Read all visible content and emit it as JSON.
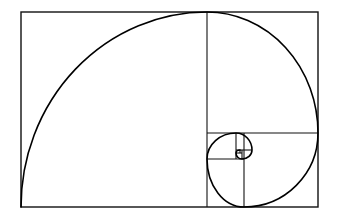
{
  "figure": {
    "background_color": "#ffffff",
    "stroke_color": "#111111",
    "spiral_color": "#000000",
    "canvas": {
      "width": 340,
      "height": 223
    }
  },
  "chart_data": {
    "type": "diagram",
    "xlabel": "",
    "ylabel": "",
    "outer_rectangle": {
      "x": 21,
      "y": 12,
      "width": 297,
      "height": 195,
      "aspect_ratio": 1.523
    },
    "squares": [
      {
        "index": 1,
        "label": "square-1",
        "x": 21,
        "y": 12,
        "size_w": 186,
        "size_h": 195,
        "arc_center_x": 207,
        "arc_center_y": 207,
        "arc_start_x": 21,
        "arc_start_y": 207,
        "arc_end_x": 207,
        "arc_end_y": 12
      },
      {
        "index": 2,
        "label": "square-2",
        "x": 207,
        "y": 12,
        "size_w": 111,
        "size_h": 121,
        "arc_center_x": 207,
        "arc_center_y": 133,
        "arc_start_x": 207,
        "arc_start_y": 12,
        "arc_end_x": 318,
        "arc_end_y": 133
      },
      {
        "index": 3,
        "label": "square-3",
        "x": 244,
        "y": 133,
        "size_w": 74,
        "size_h": 74,
        "arc_center_x": 244,
        "arc_center_y": 133,
        "arc_start_x": 318,
        "arc_start_y": 133,
        "arc_end_x": 244,
        "arc_end_y": 207
      },
      {
        "index": 4,
        "label": "square-4",
        "x": 207,
        "y": 159,
        "size_w": 45,
        "size_h": 48,
        "arc_center_x": 252,
        "arc_center_y": 159,
        "arc_start_x": 244,
        "arc_start_y": 207,
        "arc_end_x": 207,
        "arc_end_y": 159
      },
      {
        "index": 5,
        "label": "square-5",
        "x": 207,
        "y": 133,
        "size_w": 29,
        "size_h": 26,
        "arc_center_x": 236,
        "arc_center_y": 159,
        "arc_start_x": 207,
        "arc_start_y": 159,
        "arc_end_x": 236,
        "arc_end_y": 133
      },
      {
        "index": 6,
        "label": "square-6",
        "x": 236,
        "y": 133,
        "size_w": 16,
        "size_h": 17,
        "arc_center_x": 236,
        "arc_center_y": 150,
        "arc_start_x": 236,
        "arc_start_y": 133,
        "arc_end_x": 252,
        "arc_end_y": 150
      },
      {
        "index": 7,
        "label": "square-7",
        "x": 242,
        "y": 150,
        "size_w": 10,
        "size_h": 9,
        "arc_center_x": 242,
        "arc_center_y": 150,
        "arc_start_x": 252,
        "arc_start_y": 150,
        "arc_end_x": 242,
        "arc_end_y": 159
      },
      {
        "index": 8,
        "label": "square-8",
        "x": 236,
        "y": 153,
        "size_w": 6,
        "size_h": 6,
        "arc_center_x": 242,
        "arc_center_y": 153,
        "arc_start_x": 242,
        "arc_start_y": 159,
        "arc_end_x": 236,
        "arc_end_y": 153
      },
      {
        "index": 9,
        "label": "square-9",
        "x": 236,
        "y": 150,
        "size_w": 4,
        "size_h": 3,
        "arc_center_x": 240,
        "arc_center_y": 153,
        "arc_start_x": 236,
        "arc_start_y": 153,
        "arc_end_x": 240,
        "arc_end_y": 150
      }
    ],
    "divider_lines": [
      {
        "name": "divider-vertical-main",
        "x1": 207,
        "y1": 12,
        "x2": 207,
        "y2": 207
      },
      {
        "name": "divider-horizontal-sq2",
        "x1": 207,
        "y1": 133,
        "x2": 318,
        "y2": 133
      },
      {
        "name": "divider-vertical-sq3",
        "x1": 244,
        "y1": 133,
        "x2": 244,
        "y2": 207
      },
      {
        "name": "divider-horizontal-sq4",
        "x1": 207,
        "y1": 159,
        "x2": 244,
        "y2": 159
      },
      {
        "name": "divider-vertical-sq5",
        "x1": 236,
        "y1": 133,
        "x2": 236,
        "y2": 159
      },
      {
        "name": "divider-horizontal-sq6",
        "x1": 236,
        "y1": 150,
        "x2": 252,
        "y2": 150
      },
      {
        "name": "divider-vertical-sq7",
        "x1": 242,
        "y1": 150,
        "x2": 242,
        "y2": 159
      },
      {
        "name": "divider-horizontal-sq8",
        "x1": 236,
        "y1": 153,
        "x2": 242,
        "y2": 153
      },
      {
        "name": "divider-vertical-sq9",
        "x1": 240,
        "y1": 150,
        "x2": 240,
        "y2": 153
      }
    ],
    "spiral_path": "M 21 207 A 186 195 0 0 1 207 12 A 111 121 0 0 1 318 133 A 74 74 0 0 1 244 207 A 37 48 0 0 1 207 159 A 29 26 0 0 1 236 133 A 16 17 0 0 1 252 150 A 10 9 0 0 1 242 159 A 6 6 0 0 1 236 153 A 4 3 0 0 1 240 150",
    "stroke_widths": {
      "outer": 1.4,
      "divider": 1.1,
      "spiral": 1.6
    },
    "grid": false,
    "legend": null
  }
}
